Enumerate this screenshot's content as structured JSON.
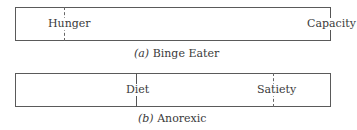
{
  "panels": [
    {
      "id": "a",
      "caption_letter": "(a)",
      "caption_text": "Binge Eater",
      "markers": [
        {
          "label": "Hunger",
          "style": "dashed"
        },
        {
          "label": "Capacity",
          "style": "solid"
        }
      ]
    },
    {
      "id": "b",
      "caption_letter": "(b)",
      "caption_text": "Anorexic",
      "markers": [
        {
          "label": "Diet",
          "style": "solid"
        },
        {
          "label": "Satiety",
          "style": "dashed"
        }
      ]
    }
  ]
}
